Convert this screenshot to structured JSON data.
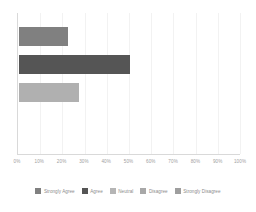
{
  "chart_data": {
    "type": "bar",
    "orientation": "horizontal",
    "title": "",
    "xlabel": "",
    "ylabel": "",
    "xlim": [
      0,
      100
    ],
    "xtick_labels": [
      "0%",
      "10%",
      "20%",
      "30%",
      "40%",
      "50%",
      "60%",
      "70%",
      "80%",
      "90%",
      "100%"
    ],
    "xtick_values": [
      0,
      10,
      20,
      30,
      40,
      50,
      60,
      70,
      80,
      90,
      100
    ],
    "grid": true,
    "grid_axis": "x",
    "legend_position": "bottom",
    "categories": [
      "Strongly Agree",
      "Agree",
      "Neutral",
      "Disagree",
      "Strongly Disagree"
    ],
    "values": [
      22,
      50,
      27,
      0,
      0
    ],
    "bars": [
      {
        "label": "Strongly Agree",
        "value": 22,
        "color": "#808080"
      },
      {
        "label": "Agree",
        "value": 50,
        "color": "#555555"
      },
      {
        "label": "Neutral",
        "value": 27,
        "color": "#b0b0b0"
      }
    ],
    "legend": [
      {
        "label": "Strongly Agree",
        "color": "#808080"
      },
      {
        "label": "Agree",
        "color": "#555555"
      },
      {
        "label": "Neutral",
        "color": "#b5b5b5"
      },
      {
        "label": "Disagree",
        "color": "#a8a8a8"
      },
      {
        "label": "Strongly Disagree",
        "color": "#9e9e9e"
      }
    ]
  },
  "colors": {
    "background": "#ffffff",
    "axis": "#d9d9d9",
    "gridline": "#f2f2f2",
    "tick_text": "#a0a0a0",
    "legend_text": "#8c8c8c"
  }
}
